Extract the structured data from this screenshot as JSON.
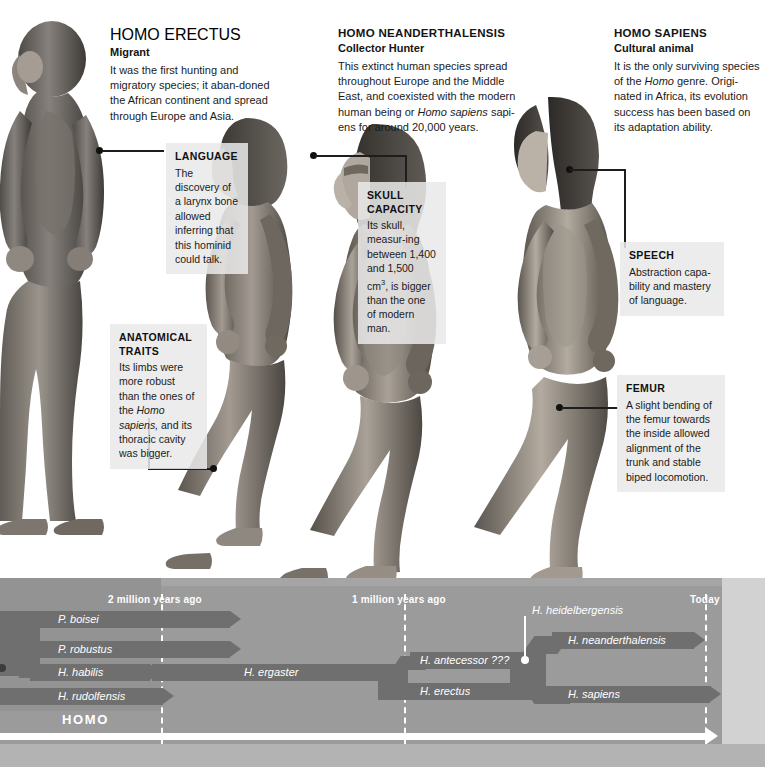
{
  "species_blocks": [
    {
      "id": "homo-erectus",
      "name": "HOMO ERECTUS",
      "subtitle": "Migrant",
      "body": "It was the first hunting and migratory species; it aban-doned the African continent and spread through Europe and Asia."
    },
    {
      "id": "homo-neanderthalensis",
      "name": "HOMO NEANDERTHALENSIS",
      "subtitle": "Collector Hunter",
      "body": "This extinct human species spread throughout Europe and the Middle East, and coexisted with the modern human being or Homo sapiens sapi-ens for around 20,000 years.",
      "italic_phrase": "Homo sapiens"
    },
    {
      "id": "homo-sapiens",
      "name": "HOMO SAPIENS",
      "subtitle": "Cultural animal",
      "body": "It is the only surviving species of the Homo genre. Origi-nated in Africa, its evolution success has been based on its adaptation ability.",
      "italic_phrase": "Homo"
    }
  ],
  "callouts": [
    {
      "id": "language",
      "title": "LANGUAGE",
      "body": "The discovery of a larynx bone allowed inferring that this hominid could talk."
    },
    {
      "id": "anatomical-traits",
      "title": "ANATOMICAL TRAITS",
      "body": "Its limbs were more robust than the ones of the Homo sapiens, and its thoracic cavity was bigger.",
      "italic_phrase": "Homo sapiens,"
    },
    {
      "id": "skull-capacity",
      "title": "SKULL CAPACITY",
      "body": "Its skull, measur-ing between 1,400 and 1,500 cm3, is bigger than the one of modern man.",
      "superscript": "3"
    },
    {
      "id": "speech",
      "title": "SPEECH",
      "body": "Abstraction capa-bility and mastery of language."
    },
    {
      "id": "femur",
      "title": "FEMUR",
      "body": "A slight bending of the femur towards the inside allowed alignment of the trunk and stable biped locomotion."
    }
  ],
  "chart_data": {
    "type": "timeline",
    "title": "HOMO",
    "xlabel": "",
    "axis_ticks": [
      {
        "label": "2 million years ago",
        "value_mya": 2.0
      },
      {
        "label": "1 million years ago",
        "value_mya": 1.0
      },
      {
        "label": "Today",
        "value_mya": 0.0
      }
    ],
    "axis_range_mya": [
      2.6,
      0.0
    ],
    "grid": "dashed vertical at each tick",
    "legend": "none",
    "group_label": "HOMO",
    "bars": [
      {
        "name": "P. boisei",
        "start_mya": 2.6,
        "end_mya": 1.25,
        "row": 0,
        "terminator": "arrow"
      },
      {
        "name": "P. robustus",
        "start_mya": 2.6,
        "end_mya": 1.25,
        "row": 1,
        "terminator": "arrow"
      },
      {
        "name": "H. habilis",
        "start_mya": 2.45,
        "end_mya": 1.95,
        "row": 2,
        "terminator": "notch"
      },
      {
        "name": "H. rudolfensis",
        "start_mya": 2.6,
        "end_mya": 1.9,
        "row": 3,
        "terminator": "arrow"
      },
      {
        "name": "H. ergaster",
        "start_mya": 1.9,
        "end_mya": 1.05,
        "row": 2,
        "terminator": "notch"
      },
      {
        "name": "H. antecessor ???",
        "start_mya": 0.95,
        "end_mya": 0.62,
        "row": 2,
        "terminator": "notch"
      },
      {
        "name": "H. erectus",
        "start_mya": 1.05,
        "end_mya": 0.52,
        "row": 3,
        "terminator": "arrow"
      },
      {
        "name": "H. neanderthalensis",
        "start_mya": 0.6,
        "end_mya": 0.05,
        "row": 1,
        "terminator": "arrow"
      },
      {
        "name": "H. sapiens",
        "start_mya": 0.6,
        "end_mya": 0.0,
        "row": 3,
        "terminator": "arrow"
      }
    ],
    "nodes": [
      {
        "name": "H. heidelbergensis",
        "value_mya": 0.62,
        "marker": "white-dot"
      }
    ]
  },
  "axis": {
    "arrow_direction": "right",
    "arrow_meaning": "time"
  }
}
